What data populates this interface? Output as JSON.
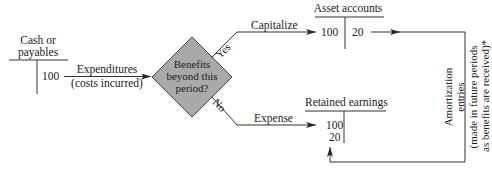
{
  "diagram": {
    "type": "flowchart",
    "cash_account": {
      "title_line1": "Cash or",
      "title_line2": "payables",
      "credit_value": "100"
    },
    "expenditure_arrow": {
      "label_line1": "Expenditures",
      "label_line2": "(costs incurred)"
    },
    "decision": {
      "line1": "Benefits",
      "line2": "beyond this",
      "line3": "period?",
      "fill_color": "#a9a9a9",
      "yes_label": "Yes",
      "no_label": "No"
    },
    "capitalize_arrow": {
      "label": "Capitalize"
    },
    "expense_arrow": {
      "label": "Expense"
    },
    "asset_account": {
      "title": "Asset accounts",
      "debit_value": "100",
      "credit_value": "20"
    },
    "retained_earnings": {
      "title": "Retained earnings",
      "debit_value_1": "100",
      "debit_value_2": "20"
    },
    "amortization_note": {
      "line1": "Amortization",
      "line2": "entries",
      "line3": "(made in future periods",
      "line4": "as benefits are received)*"
    }
  }
}
